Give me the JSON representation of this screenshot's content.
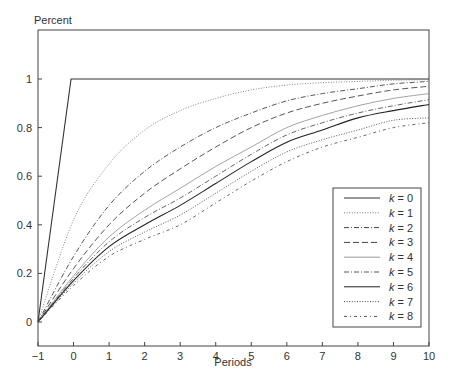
{
  "chart_data": {
    "type": "line",
    "title": "",
    "ylabel": "Percent",
    "xlabel": "Periods",
    "xlim": [
      -1,
      10
    ],
    "ylim": [
      -0.13,
      1.2
    ],
    "grid": false,
    "legend_position": "lower right",
    "x_ticks": [
      -1,
      0,
      1,
      2,
      3,
      4,
      5,
      6,
      7,
      8,
      9,
      10
    ],
    "y_ticks": [
      0,
      0.2,
      0.4,
      0.6,
      0.8,
      1
    ],
    "y_tick_labels": [
      "0",
      "0.2",
      "0.4",
      "0.6",
      "0.8",
      "1"
    ],
    "x": [
      -1,
      0,
      1,
      2,
      3,
      4,
      5,
      6,
      7,
      8,
      9,
      10
    ],
    "series": [
      {
        "name": "k = 0",
        "style": "solid",
        "color": "#333333",
        "values": [
          0,
          1,
          1,
          1,
          1,
          1,
          1,
          1,
          1,
          1,
          1,
          1
        ]
      },
      {
        "name": "k = 1",
        "style": "dotted",
        "color": "#777777",
        "values": [
          0,
          0.42,
          0.65,
          0.79,
          0.87,
          0.92,
          0.955,
          0.975,
          0.985,
          0.99,
          0.995,
          0.997
        ]
      },
      {
        "name": "k = 2",
        "style": "dashdot",
        "color": "#444444",
        "values": [
          0,
          0.27,
          0.48,
          0.62,
          0.72,
          0.8,
          0.86,
          0.91,
          0.94,
          0.96,
          0.98,
          0.99
        ]
      },
      {
        "name": "k = 3",
        "style": "dashed",
        "color": "#444444",
        "values": [
          0,
          0.22,
          0.4,
          0.53,
          0.63,
          0.72,
          0.8,
          0.86,
          0.9,
          0.93,
          0.955,
          0.97
        ]
      },
      {
        "name": "k = 4",
        "style": "solid",
        "color": "#999999",
        "values": [
          0,
          0.19,
          0.35,
          0.46,
          0.55,
          0.64,
          0.72,
          0.8,
          0.85,
          0.89,
          0.92,
          0.94
        ]
      },
      {
        "name": "k = 5",
        "style": "dashdot",
        "color": "#555555",
        "values": [
          0,
          0.18,
          0.33,
          0.43,
          0.51,
          0.6,
          0.69,
          0.77,
          0.82,
          0.86,
          0.89,
          0.915
        ]
      },
      {
        "name": "k = 6",
        "style": "solid",
        "color": "#222222",
        "values": [
          0,
          0.17,
          0.31,
          0.4,
          0.48,
          0.57,
          0.66,
          0.74,
          0.79,
          0.84,
          0.87,
          0.895
        ]
      },
      {
        "name": "k = 7",
        "style": "dotted",
        "color": "#444444",
        "values": [
          0,
          0.16,
          0.29,
          0.37,
          0.44,
          0.53,
          0.62,
          0.7,
          0.75,
          0.79,
          0.83,
          0.84
        ]
      },
      {
        "name": "k = 8",
        "style": "dashdot2",
        "color": "#555555",
        "values": [
          0,
          0.15,
          0.27,
          0.34,
          0.4,
          0.49,
          0.58,
          0.66,
          0.72,
          0.76,
          0.8,
          0.82
        ]
      }
    ]
  },
  "labels": {
    "ylabel": "Percent",
    "xlabel": "Periods",
    "legend_var": "k",
    "legend_entries": [
      "k = 0",
      "k = 1",
      "k = 2",
      "k = 3",
      "k = 4",
      "k = 5",
      "k = 6",
      "k = 7",
      "k = 8"
    ]
  }
}
